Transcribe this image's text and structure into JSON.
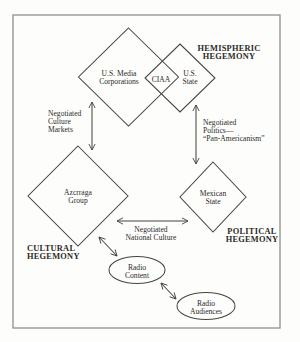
{
  "page": {
    "background": "#fdfdfc",
    "border": {
      "x": 13,
      "y": 15,
      "w": 267,
      "h": 313,
      "color": "#979792",
      "width": 1.4
    }
  },
  "styles": {
    "stroke_color": "#454540",
    "stroke_width": 1.05,
    "text_color": "#2b2b28",
    "label_font_size": 7.6,
    "bold_font_size": 8.4,
    "label_line_height": 8,
    "bold_line_height": 8.6
  },
  "nodes": [
    {
      "id": "us-media-corporations",
      "shape": "diamond",
      "cx": 128.5,
      "cy": 77,
      "rx": 50,
      "ry": 49,
      "label": [
        "U.S. Media",
        "Corporations"
      ],
      "tx": 119,
      "ty": 73.5
    },
    {
      "id": "us-state",
      "shape": "diamond",
      "cx": 180,
      "cy": 78,
      "rx": 35,
      "ry": 34,
      "label": [
        "U.S.",
        "State"
      ],
      "tx": 190,
      "ty": 73.5
    },
    {
      "id": "ciaa",
      "shape": "none",
      "label": [
        "CIAA"
      ],
      "tx": 161,
      "ty": 79.5
    },
    {
      "id": "azcrraga-group",
      "shape": "diamond",
      "cx": 78,
      "cy": 196,
      "rx": 50,
      "ry": 50,
      "label": [
        "Azcrraga",
        "Group"
      ],
      "tx": 78,
      "ty": 192
    },
    {
      "id": "mexican-state",
      "shape": "diamond",
      "cx": 213,
      "cy": 197,
      "rx": 33,
      "ry": 35,
      "label": [
        "Mexican",
        "State"
      ],
      "tx": 213,
      "ty": 193
    },
    {
      "id": "radio-content",
      "shape": "ellipse",
      "cx": 137,
      "cy": 270,
      "rx": 28,
      "ry": 13.5,
      "label": [
        "Radio",
        "Content"
      ],
      "tx": 137,
      "ty": 267
    },
    {
      "id": "radio-audiences",
      "shape": "ellipse",
      "cx": 206,
      "cy": 306,
      "rx": 29,
      "ry": 13.5,
      "label": [
        "Radio",
        "Audiences"
      ],
      "tx": 206,
      "ty": 303
    }
  ],
  "labels": [
    {
      "id": "hemispheric-hegemony",
      "lines": [
        "HEMISPHERIC",
        "HEGEMONY"
      ],
      "x": 229,
      "y": 48,
      "align": "middle",
      "bold": true
    },
    {
      "id": "negotiated-culture-markets",
      "lines": [
        "Negotiated",
        "Culture",
        "Markets"
      ],
      "x": 48,
      "y": 113,
      "align": "start",
      "bold": false
    },
    {
      "id": "negotiated-politics-pan-americanism",
      "lines": [
        "Negotiated",
        "Politics—",
        "“Pan-Americanism”"
      ],
      "x": 203,
      "y": 122,
      "align": "start",
      "bold": false
    },
    {
      "id": "negotiated-national-culture",
      "lines": [
        "Negotiated",
        "National Culture"
      ],
      "x": 151,
      "y": 229.5,
      "align": "middle",
      "bold": false
    },
    {
      "id": "political-hegemony",
      "lines": [
        "POLITICAL",
        "HEGEMONY"
      ],
      "x": 252,
      "y": 231,
      "align": "middle",
      "bold": true
    },
    {
      "id": "cultural-hegemony",
      "lines": [
        "CULTURAL",
        "HEGEMONY"
      ],
      "x": 27,
      "y": 248,
      "align": "start",
      "bold": true
    }
  ],
  "arrows": [
    {
      "id": "arrow-culture-markets",
      "x1": 92,
      "y1": 102,
      "x2": 92,
      "y2": 150
    },
    {
      "id": "arrow-politics",
      "x1": 196,
      "y1": 105,
      "x2": 196,
      "y2": 164
    },
    {
      "id": "arrow-national-culture",
      "x1": 117,
      "y1": 221,
      "x2": 188,
      "y2": 221
    },
    {
      "id": "arrow-radio-content",
      "x1": 99,
      "y1": 237,
      "x2": 117,
      "y2": 256
    },
    {
      "id": "arrow-radio-audiences",
      "x1": 161,
      "y1": 283,
      "x2": 176,
      "y2": 299
    }
  ]
}
